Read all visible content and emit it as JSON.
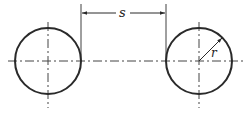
{
  "diagram": {
    "type": "engineering-drawing",
    "colors": {
      "stroke": "#2a2a2a",
      "centerline": "#444444",
      "background": "#ffffff"
    },
    "circles": [
      {
        "id": "left",
        "cx": 48,
        "cy": 61,
        "r": 33
      },
      {
        "id": "right",
        "cx": 199,
        "cy": 61,
        "r": 33
      }
    ],
    "dimensions": {
      "spacing": {
        "label": "s",
        "x1": 81,
        "x2": 166,
        "y": 13
      },
      "radius": {
        "label": "r"
      }
    }
  }
}
